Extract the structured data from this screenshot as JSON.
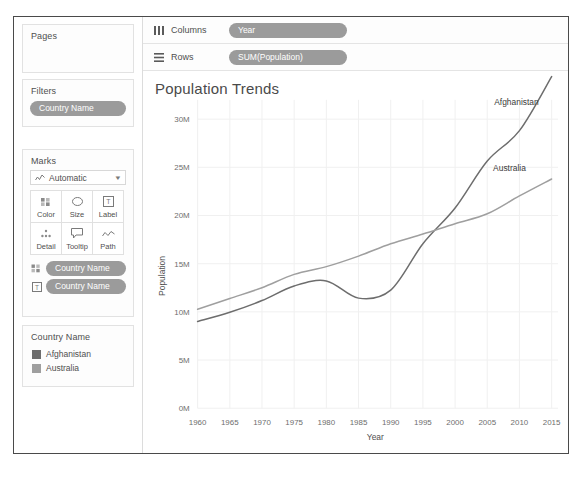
{
  "sidebar": {
    "pages": {
      "title": "Pages"
    },
    "filters": {
      "title": "Filters",
      "pills": [
        {
          "label": "Country Name"
        }
      ]
    },
    "marks": {
      "title": "Marks",
      "mark_type": "Automatic",
      "mark_type_icon": "line-chart-icon",
      "buttons": [
        {
          "label": "Color",
          "icon": "color-palette-icon"
        },
        {
          "label": "Size",
          "icon": "size-icon"
        },
        {
          "label": "Label",
          "icon": "label-icon"
        },
        {
          "label": "Detail",
          "icon": "detail-icon"
        },
        {
          "label": "Tooltip",
          "icon": "tooltip-icon"
        },
        {
          "label": "Path",
          "icon": "path-icon"
        }
      ],
      "pills": [
        {
          "label": "Country Name",
          "icon": "color-palette-icon"
        },
        {
          "label": "Country Name",
          "icon": "label-icon"
        }
      ]
    },
    "legend": {
      "title": "Country Name",
      "items": [
        {
          "label": "Afghanistan",
          "color": "#6d6d6d"
        },
        {
          "label": "Australia",
          "color": "#9f9f9f"
        }
      ]
    }
  },
  "worksheet": {
    "shelves": [
      {
        "name": "Columns",
        "icon": "columns-icon",
        "pill": "Year"
      },
      {
        "name": "Rows",
        "icon": "rows-icon",
        "pill": "SUM(Population)"
      }
    ]
  },
  "colors": {
    "pill_background": "#9b9b9b",
    "pill_text": "#ffffff",
    "afghanistan": "#6d6d6d",
    "australia": "#9f9f9f",
    "frame_border": "#4a4a4a",
    "panel_border": "#e2e2e2",
    "text": "#4f4f4f"
  },
  "chart_data": {
    "type": "line",
    "title": "Population Trends",
    "xlabel": "Year",
    "ylabel": "Population",
    "xlim": [
      1960,
      2016
    ],
    "ylim": [
      0,
      32000000
    ],
    "xticks": [
      1960,
      1965,
      1970,
      1975,
      1980,
      1985,
      1990,
      1995,
      2000,
      2005,
      2010,
      2015
    ],
    "yticks": [
      0,
      5000000,
      10000000,
      15000000,
      20000000,
      25000000,
      30000000
    ],
    "ytick_labels": [
      "0M",
      "5M",
      "10M",
      "15M",
      "20M",
      "25M",
      "30M"
    ],
    "xtick_labels": [
      "1960",
      "1965",
      "1970",
      "1975",
      "1980",
      "1985",
      "1990",
      "1995",
      "2000",
      "2005",
      "2010",
      "2015"
    ],
    "grid": true,
    "legend_position": "sidebar",
    "annotations": [
      {
        "text": "Afghanistan",
        "x": 2013,
        "y": 31500000
      },
      {
        "text": "Australia",
        "x": 2011,
        "y": 24600000
      }
    ],
    "x": [
      1960,
      1965,
      1970,
      1975,
      1980,
      1985,
      1990,
      1995,
      2000,
      2005,
      2010,
      2015
    ],
    "series": [
      {
        "name": "Afghanistan",
        "color": "#6d6d6d",
        "values": [
          8996351,
          9956320,
          11173654,
          12689160,
          13211412,
          11424975,
          12249114,
          17065836,
          20779953,
          25654277,
          28803167,
          34413603
        ]
      },
      {
        "name": "Australia",
        "color": "#9f9f9f",
        "values": [
          10275020,
          11387650,
          12507349,
          13893000,
          14695360,
          15788312,
          17065100,
          18072000,
          19153000,
          20176844,
          22031750,
          23789752
        ]
      }
    ]
  }
}
